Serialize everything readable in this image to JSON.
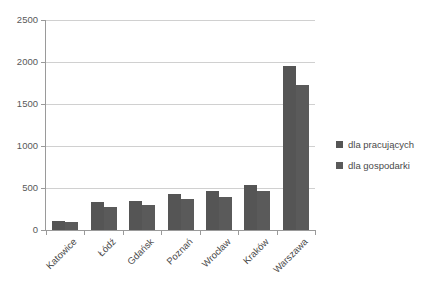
{
  "chart_data": {
    "type": "bar",
    "title": "",
    "subtitle": "",
    "xlabel": "",
    "ylabel": "",
    "ylim": [
      0,
      2500
    ],
    "ytick_step": 500,
    "yticks": [
      "0",
      "500",
      "1000",
      "1500",
      "2000",
      "2500"
    ],
    "grid": true,
    "legend_position": "right",
    "categories": [
      "Katowice",
      "Łódź",
      "Gdańsk",
      "Poznań",
      "Wrocław",
      "Kraków",
      "Warszawa"
    ],
    "series": [
      {
        "name": "dla pracujących",
        "color": "#555555",
        "values": [
          110,
          330,
          350,
          425,
          460,
          540,
          1955
        ]
      },
      {
        "name": "dla gospodarki",
        "color": "#5a5a5a",
        "values": [
          90,
          275,
          300,
          365,
          390,
          460,
          1730
        ]
      }
    ]
  },
  "legend": {
    "items": [
      {
        "label": "dla pracujących",
        "color": "#555555"
      },
      {
        "label": "dla gospodarki",
        "color": "#5a5a5a"
      }
    ]
  },
  "colors": {
    "series1": "#555555",
    "series2": "#5a5a5a",
    "gridline": "#d0d0d0",
    "axis": "#9a9a9a",
    "text": "#595959",
    "background": "#ffffff"
  }
}
